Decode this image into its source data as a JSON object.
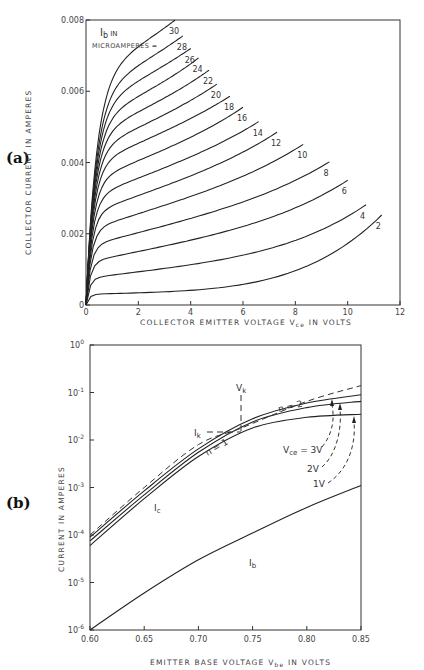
{
  "chart_data": [
    {
      "id": "a",
      "panel_label": "(a)",
      "type": "line",
      "title": "",
      "legend_title_line1": "I_b IN",
      "legend_title_line2": "MICROAMPERES =",
      "xlabel": "COLLECTOR EMITTER VOLTAGE V_ce IN VOLTS",
      "ylabel": "COLLECTOR CURRENT IN AMPERES",
      "xlim": [
        0,
        12
      ],
      "ylim": [
        0,
        0.008
      ],
      "xticks": [
        "0",
        "2",
        "4",
        "6",
        "8",
        "10",
        "12"
      ],
      "yticks": [
        "0",
        "0.002",
        "0.004",
        "0.006",
        "0.008"
      ],
      "grid": false,
      "series": [
        {
          "name": "2",
          "end_vce": 11.3,
          "sat": 0.0003,
          "slope": 2e-05,
          "rise": 0.002
        },
        {
          "name": "4",
          "end_vce": 10.7,
          "sat": 0.00075,
          "slope": 9e-05,
          "rise": 0.0011
        },
        {
          "name": "6",
          "end_vce": 10.0,
          "sat": 0.0012,
          "slope": 0.00015,
          "rise": 0.0008
        },
        {
          "name": "8",
          "end_vce": 9.3,
          "sat": 0.00165,
          "slope": 0.00019,
          "rise": 0.0006
        },
        {
          "name": "10",
          "end_vce": 8.3,
          "sat": 0.0021,
          "slope": 0.00023,
          "rise": 0.0005
        },
        {
          "name": "12",
          "end_vce": 7.3,
          "sat": 0.00255,
          "slope": 0.00026,
          "rise": 0.0004
        },
        {
          "name": "14",
          "end_vce": 6.6,
          "sat": 0.003,
          "slope": 0.00028,
          "rise": 0.0003
        },
        {
          "name": "16",
          "end_vce": 6.0,
          "sat": 0.00345,
          "slope": 0.0003,
          "rise": 0.0003
        },
        {
          "name": "18",
          "end_vce": 5.5,
          "sat": 0.0039,
          "slope": 0.00032,
          "rise": 0.0002
        },
        {
          "name": "20",
          "end_vce": 5.0,
          "sat": 0.0043,
          "slope": 0.00034,
          "rise": 0.0002
        },
        {
          "name": "22",
          "end_vce": 4.7,
          "sat": 0.0047,
          "slope": 0.00036,
          "rise": 0.0002
        },
        {
          "name": "24",
          "end_vce": 4.3,
          "sat": 0.0051,
          "slope": 0.00038,
          "rise": 0.0002
        },
        {
          "name": "26",
          "end_vce": 4.0,
          "sat": 0.0055,
          "slope": 0.0004,
          "rise": 0.0001
        },
        {
          "name": "28",
          "end_vce": 3.7,
          "sat": 0.0059,
          "slope": 0.00042,
          "rise": 0.0001
        },
        {
          "name": "30",
          "end_vce": 3.4,
          "sat": 0.0064,
          "slope": 0.00044,
          "rise": 0.0001
        }
      ]
    },
    {
      "id": "b",
      "panel_label": "(b)",
      "type": "line",
      "title": "",
      "xlabel": "EMITTER BASE VOLTAGE V_be IN VOLTS",
      "ylabel": "CURRENT IN AMPERES",
      "xlim": [
        0.6,
        0.85
      ],
      "ylim": [
        1e-06,
        1
      ],
      "yscale": "log",
      "xticks": [
        "0.60",
        "0.65",
        "0.70",
        "0.75",
        "0.80",
        "0.85"
      ],
      "yticks": [
        "10^0",
        "10^-1",
        "10^-2",
        "10^-3",
        "10^-4",
        "10^-5",
        "10^-6"
      ],
      "grid": false,
      "series": [
        {
          "name": "I_c (V_ce = 3V)",
          "x": [
            0.6,
            0.65,
            0.7,
            0.75,
            0.8,
            0.85
          ],
          "values": [
            9e-05,
            0.00085,
            0.0065,
            0.028,
            0.06,
            0.09
          ]
        },
        {
          "name": "I_c (V_ce = 2V)",
          "x": [
            0.6,
            0.65,
            0.7,
            0.75,
            0.8,
            0.85
          ],
          "values": [
            7.5e-05,
            0.0007,
            0.0055,
            0.024,
            0.048,
            0.065
          ]
        },
        {
          "name": "I_c (V_ce = 1V)",
          "x": [
            0.6,
            0.65,
            0.7,
            0.75,
            0.8,
            0.85
          ],
          "values": [
            6e-05,
            0.00058,
            0.0045,
            0.018,
            0.03,
            0.035
          ]
        },
        {
          "name": "ideal (n=1 / n=2)",
          "style": "dashed",
          "x": [
            0.6,
            0.65,
            0.7,
            0.74,
            0.8,
            0.85
          ],
          "values": [
            0.0001,
            0.001,
            0.008,
            0.018,
            0.065,
            0.14
          ]
        },
        {
          "name": "I_b",
          "x": [
            0.6,
            0.65,
            0.7,
            0.75,
            0.8,
            0.85
          ],
          "values": [
            1e-06,
            6e-06,
            3e-05,
            0.00011,
            0.00038,
            0.0011
          ]
        }
      ],
      "annotations": {
        "vk": "V_k",
        "ik": "I_k",
        "n1": "n = 1",
        "n2": "n = 2",
        "vce3": "V_ce = 3V",
        "vce2": "2V",
        "vce1": "1V",
        "ic": "I_c",
        "ib": "I_b"
      }
    }
  ]
}
